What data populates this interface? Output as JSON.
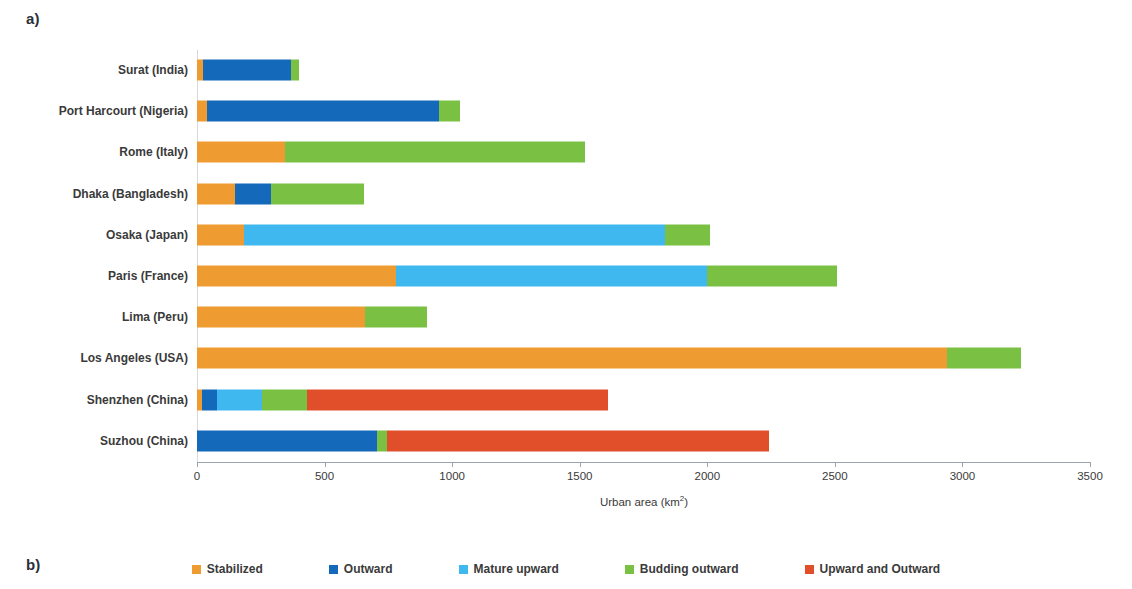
{
  "panels": {
    "a_label": "a)",
    "b_label": "b)"
  },
  "chart_data": {
    "type": "bar",
    "orientation": "horizontal",
    "stacked": true,
    "title": "",
    "xlabel": "Urban area (km2)",
    "xlabel_base": "Urban area (km",
    "xlabel_sup": "2",
    "xlabel_tail": ")",
    "ylabel": "",
    "xlim": [
      0,
      3500
    ],
    "xticks": [
      0,
      500,
      1000,
      1500,
      2000,
      2500,
      3000,
      3500
    ],
    "xticklabels": [
      "0",
      "500",
      "1000",
      "1500",
      "2000",
      "2500",
      "3000",
      "3500"
    ],
    "grid": false,
    "legend_position": "bottom-center",
    "categories": [
      "Surat (India)",
      "Port Harcourt (Nigeria)",
      "Rome (Italy)",
      "Dhaka (Bangladesh)",
      "Osaka (Japan)",
      "Paris (France)",
      "Lima (Peru)",
      "Los Angeles (USA)",
      "Shenzhen (China)",
      "Suzhou (China)"
    ],
    "series": [
      {
        "name": "Stabilized",
        "color": "#ee9c31",
        "values": [
          25,
          40,
          345,
          150,
          185,
          780,
          660,
          2940,
          20,
          0
        ]
      },
      {
        "name": "Outward",
        "color": "#1569bb",
        "values": [
          345,
          910,
          0,
          140,
          0,
          0,
          0,
          0,
          60,
          705
        ]
      },
      {
        "name": "Mature upward",
        "color": "#3fb7ef",
        "values": [
          0,
          0,
          0,
          0,
          1650,
          1220,
          0,
          0,
          175,
          0
        ]
      },
      {
        "name": "Budding outward",
        "color": "#7ac143",
        "values": [
          30,
          80,
          1175,
          365,
          175,
          510,
          240,
          290,
          175,
          40
        ]
      },
      {
        "name": "Upward and Outward",
        "color": "#e04e2a",
        "values": [
          0,
          0,
          0,
          0,
          0,
          0,
          0,
          0,
          1180,
          1495
        ]
      }
    ],
    "totals": [
      400,
      1030,
      1520,
      655,
      2010,
      2510,
      900,
      3230,
      1610,
      2240
    ]
  },
  "legend": {
    "items": [
      {
        "label": "Stabilized",
        "color": "#ee9c31"
      },
      {
        "label": "Outward",
        "color": "#1569bb"
      },
      {
        "label": "Mature upward",
        "color": "#3fb7ef"
      },
      {
        "label": "Budding outward",
        "color": "#7ac143"
      },
      {
        "label": "Upward and Outward",
        "color": "#e04e2a"
      }
    ]
  }
}
